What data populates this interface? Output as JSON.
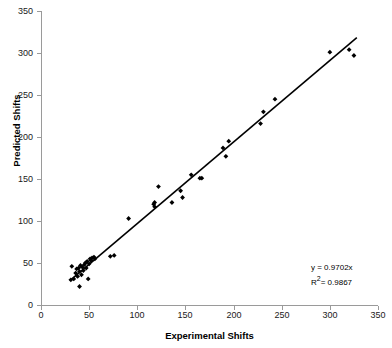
{
  "chart_data": {
    "type": "scatter",
    "title": "",
    "xlabel": "Experimental Shifts",
    "ylabel": "Predicted Shifts",
    "xlim": [
      0,
      350
    ],
    "ylim": [
      0,
      350
    ],
    "xticks": [
      0,
      50,
      100,
      150,
      200,
      250,
      300,
      350
    ],
    "yticks": [
      0,
      50,
      100,
      150,
      200,
      250,
      300,
      350
    ],
    "grid": false,
    "legend": "none",
    "marker": "diamond",
    "marker_color": "#000000",
    "annotations": {
      "equation": "y = 0.9702x",
      "r_squared_prefix": "R",
      "r_squared_exponent": "2",
      "r_squared_value": "= 0.9867"
    },
    "trendline": {
      "type": "linear-through-origin",
      "slope": 0.9702,
      "intercept": 0,
      "r_squared": 0.9867,
      "x_start": 30,
      "x_end": 328,
      "color": "#000000"
    },
    "points": [
      {
        "x": 31,
        "y": 30
      },
      {
        "x": 32,
        "y": 46
      },
      {
        "x": 34,
        "y": 31
      },
      {
        "x": 36,
        "y": 38
      },
      {
        "x": 37,
        "y": 43
      },
      {
        "x": 38,
        "y": 34
      },
      {
        "x": 39,
        "y": 44
      },
      {
        "x": 40,
        "y": 22
      },
      {
        "x": 40,
        "y": 40
      },
      {
        "x": 41,
        "y": 47
      },
      {
        "x": 42,
        "y": 36
      },
      {
        "x": 43,
        "y": 45
      },
      {
        "x": 44,
        "y": 41
      },
      {
        "x": 45,
        "y": 48
      },
      {
        "x": 46,
        "y": 50
      },
      {
        "x": 47,
        "y": 44
      },
      {
        "x": 48,
        "y": 52
      },
      {
        "x": 49,
        "y": 31
      },
      {
        "x": 50,
        "y": 49
      },
      {
        "x": 51,
        "y": 55
      },
      {
        "x": 52,
        "y": 53
      },
      {
        "x": 53,
        "y": 56
      },
      {
        "x": 55,
        "y": 57
      },
      {
        "x": 56,
        "y": 55
      },
      {
        "x": 72,
        "y": 58
      },
      {
        "x": 76,
        "y": 59
      },
      {
        "x": 91,
        "y": 103
      },
      {
        "x": 117,
        "y": 120
      },
      {
        "x": 118,
        "y": 117
      },
      {
        "x": 118,
        "y": 122
      },
      {
        "x": 122,
        "y": 141
      },
      {
        "x": 136,
        "y": 122
      },
      {
        "x": 145,
        "y": 136
      },
      {
        "x": 147,
        "y": 128
      },
      {
        "x": 156,
        "y": 155
      },
      {
        "x": 165,
        "y": 151
      },
      {
        "x": 167,
        "y": 151
      },
      {
        "x": 189,
        "y": 187
      },
      {
        "x": 192,
        "y": 177
      },
      {
        "x": 195,
        "y": 195
      },
      {
        "x": 228,
        "y": 216
      },
      {
        "x": 231,
        "y": 230
      },
      {
        "x": 243,
        "y": 245
      },
      {
        "x": 300,
        "y": 301
      },
      {
        "x": 320,
        "y": 304
      },
      {
        "x": 325,
        "y": 297
      }
    ]
  }
}
